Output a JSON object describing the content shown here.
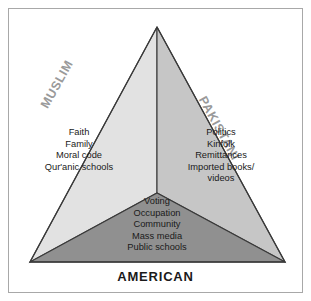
{
  "figure": {
    "type": "venn-triangle-diagram",
    "title_bottom": "AMERICAN",
    "border_color": "#a8a8a8",
    "background": "#ffffff"
  },
  "regions": {
    "muslim": {
      "label": "MUSLIM",
      "label_color": "#9a9a9a",
      "fill": "#e2e2e2",
      "items": [
        "Faith",
        "Family",
        "Moral code",
        "Qur'anic schools"
      ]
    },
    "pakistani": {
      "label": "PAKISTANI",
      "label_color": "#9a9a9a",
      "fill": "#c6c6c6",
      "items": [
        "Politics",
        "Kinfolk",
        "Remittances",
        "Imported books/",
        "videos"
      ]
    },
    "american": {
      "label": "AMERICAN",
      "label_color": "#1a1a1a",
      "fill": "#909090",
      "items": [
        "Voting",
        "Occupation",
        "Community",
        "Mass media",
        "Public schools"
      ]
    }
  },
  "geometry": {
    "apex": "157,27",
    "bottom_left": "30,262",
    "bottom_right": "285,262",
    "center": "157,193",
    "stroke_color": "#3a3a3a"
  }
}
